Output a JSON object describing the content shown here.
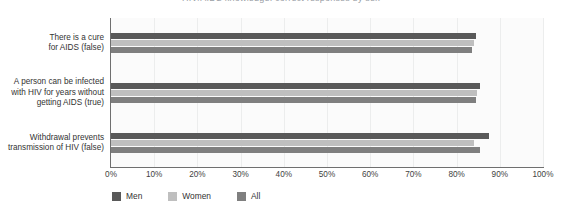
{
  "title": {
    "text": "HIV/AIDS knowledge: correct responses by sex"
  },
  "chart_data": {
    "type": "bar",
    "orientation": "horizontal",
    "title": "HIV/AIDS knowledge: correct responses by sex",
    "xlabel": "",
    "ylabel": "",
    "xlim": [
      0,
      100
    ],
    "xticks": [
      0,
      10,
      20,
      30,
      40,
      50,
      60,
      70,
      80,
      90,
      100
    ],
    "xtick_labels": [
      "0%",
      "10%",
      "20%",
      "30%",
      "40%",
      "50%",
      "60%",
      "70%",
      "80%",
      "90%",
      "100%"
    ],
    "grid": true,
    "legend_position": "bottom-left",
    "categories": [
      "There is a cure\nfor AIDS (false)",
      "A person can be infected\nwith HIV for years without\ngetting AIDS (true)",
      "Withdrawal prevents\ntransmission of HIV (false)"
    ],
    "series": [
      {
        "name": "Men",
        "color": "#595959",
        "values": [
          84.5,
          85.5,
          87.5
        ]
      },
      {
        "name": "Women",
        "color": "#bfbfbf",
        "values": [
          84.0,
          84.8,
          84.0
        ]
      },
      {
        "name": "All",
        "color": "#7f7f7f",
        "values": [
          83.5,
          84.5,
          85.5
        ]
      }
    ]
  },
  "legend": {
    "items": [
      {
        "label": "Men",
        "color": "#595959"
      },
      {
        "label": "Women",
        "color": "#bfbfbf"
      },
      {
        "label": "All",
        "color": "#7f7f7f"
      }
    ]
  }
}
